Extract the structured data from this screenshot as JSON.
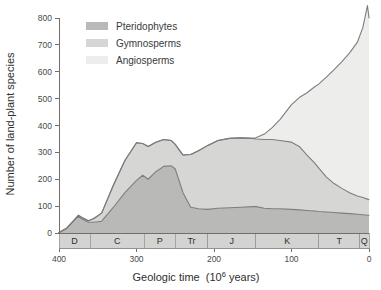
{
  "figure": {
    "background_color": "#ffffff"
  },
  "legend": {
    "position": "top-left-inside",
    "entries": [
      {
        "label": "Pteridophytes",
        "color": "#b9b9b7",
        "swatch_name": "legend-swatch-pteridophytes"
      },
      {
        "label": "Gymnosperms",
        "color": "#d6d6d4",
        "swatch_name": "legend-swatch-gymnosperms"
      },
      {
        "label": "Angiosperms",
        "color": "#ededeb",
        "swatch_name": "legend-swatch-angiosperms"
      }
    ]
  },
  "axes": {
    "y": {
      "label": "Number of land-plant species",
      "min": 0,
      "max": 800,
      "tick_step": 100,
      "ticks": [
        0,
        100,
        200,
        300,
        400,
        500,
        600,
        700,
        800
      ],
      "tick_labels": [
        "0",
        "100",
        "200",
        "300",
        "400",
        "500",
        "600",
        "700",
        "800"
      ]
    },
    "x": {
      "label_main": "Geologic time",
      "label_units": "(10",
      "label_exponent": "6",
      "label_units_tail": " years)",
      "label_full": "Geologic time  (10⁶ years)",
      "min": 0,
      "max": 400,
      "reversed": true,
      "ticks": [
        400,
        300,
        200,
        100,
        0
      ],
      "tick_labels": [
        "400",
        "300",
        "200",
        "100",
        "0"
      ]
    }
  },
  "period_band": {
    "name": "geologic-period-band",
    "fill_color": "#d3d3d1",
    "periods": [
      {
        "code": "D",
        "start_ma": 400,
        "end_ma": 360
      },
      {
        "code": "C",
        "start_ma": 360,
        "end_ma": 290
      },
      {
        "code": "P",
        "start_ma": 290,
        "end_ma": 250
      },
      {
        "code": "Tr",
        "start_ma": 250,
        "end_ma": 208
      },
      {
        "code": "J",
        "start_ma": 208,
        "end_ma": 146
      },
      {
        "code": "K",
        "start_ma": 146,
        "end_ma": 65
      },
      {
        "code": "T",
        "start_ma": 65,
        "end_ma": 12
      },
      {
        "code": "Q",
        "start_ma": 12,
        "end_ma": 0
      }
    ]
  },
  "chart_data": {
    "type": "area",
    "stacked": true,
    "title": "",
    "subtitle": "",
    "xlabel": "Geologic time  (10⁶ years)",
    "ylabel": "Number of land-plant species",
    "xlim": [
      400,
      0
    ],
    "ylim": [
      0,
      800
    ],
    "x_reversed": true,
    "grid": false,
    "legend_position": "upper left",
    "x": [
      400,
      390,
      380,
      375,
      370,
      362,
      355,
      345,
      330,
      315,
      300,
      292,
      285,
      275,
      265,
      255,
      250,
      240,
      230,
      220,
      208,
      195,
      180,
      165,
      150,
      146,
      135,
      125,
      115,
      100,
      90,
      80,
      70,
      65,
      55,
      45,
      35,
      25,
      15,
      8,
      2,
      0
    ],
    "series": [
      {
        "name": "Pteridophytes",
        "color": "#b9b9b7",
        "values": [
          2,
          18,
          48,
          62,
          52,
          40,
          40,
          44,
          95,
          150,
          196,
          215,
          200,
          228,
          248,
          250,
          238,
          150,
          96,
          90,
          88,
          92,
          94,
          96,
          98,
          98,
          92,
          90,
          90,
          88,
          86,
          84,
          82,
          80,
          78,
          76,
          74,
          72,
          70,
          68,
          66,
          66
        ]
      },
      {
        "name": "Gymnosperms",
        "color": "#d6d6d4",
        "values": [
          0,
          0,
          2,
          4,
          5,
          6,
          14,
          30,
          82,
          120,
          140,
          118,
          122,
          110,
          100,
          94,
          92,
          140,
          196,
          216,
          238,
          252,
          258,
          258,
          254,
          252,
          256,
          258,
          254,
          250,
          236,
          206,
          178,
          162,
          130,
          108,
          92,
          78,
          68,
          64,
          60,
          58
        ]
      },
      {
        "name": "Angiosperms",
        "color": "#ededeb",
        "values": [
          0,
          0,
          0,
          0,
          0,
          0,
          0,
          0,
          0,
          0,
          0,
          0,
          0,
          0,
          0,
          0,
          0,
          0,
          0,
          0,
          0,
          0,
          0,
          0,
          0,
          4,
          20,
          44,
          78,
          140,
          182,
          232,
          284,
          312,
          372,
          424,
          472,
          520,
          572,
          632,
          720,
          676
        ]
      }
    ],
    "cumulative_top_values": {
      "pteridophytes": [
        2,
        18,
        48,
        62,
        52,
        40,
        40,
        44,
        95,
        150,
        196,
        215,
        200,
        228,
        248,
        250,
        238,
        150,
        96,
        90,
        88,
        92,
        94,
        96,
        98,
        98,
        92,
        90,
        90,
        88,
        86,
        84,
        82,
        80,
        78,
        76,
        74,
        72,
        70,
        68,
        66,
        66
      ],
      "gymnosperms": [
        2,
        18,
        50,
        66,
        57,
        46,
        54,
        74,
        177,
        270,
        336,
        333,
        322,
        338,
        348,
        344,
        330,
        290,
        292,
        306,
        326,
        344,
        352,
        354,
        352,
        350,
        348,
        348,
        344,
        338,
        322,
        290,
        260,
        242,
        208,
        184,
        166,
        150,
        138,
        132,
        126,
        124
      ],
      "angiosperms": [
        2,
        18,
        50,
        66,
        57,
        46,
        54,
        74,
        177,
        270,
        336,
        333,
        322,
        338,
        348,
        344,
        330,
        290,
        292,
        306,
        326,
        344,
        352,
        354,
        352,
        354,
        368,
        392,
        422,
        478,
        504,
        522,
        544,
        554,
        580,
        608,
        638,
        670,
        710,
        764,
        846,
        800
      ]
    },
    "annotations": [
      {
        "text": "Angiosperms radiate rapidly from the mid-Cretaceous onward",
        "x_ma": 80,
        "shown": false
      }
    ]
  }
}
